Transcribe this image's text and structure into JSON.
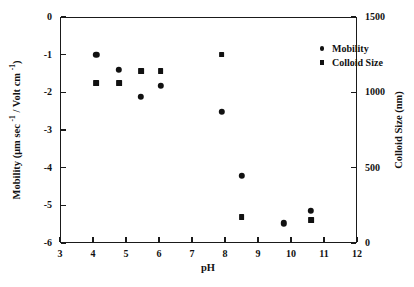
{
  "chart_data": {
    "type": "scatter",
    "title": "",
    "xlabel": "pH",
    "ylabel": "Mobility (μm sec -1 / Volt cm -1)",
    "ylabel_right": "Colloid Size (nm)",
    "xlim": [
      3,
      12
    ],
    "ylim": [
      -6,
      0
    ],
    "ylim_right": [
      0,
      1500
    ],
    "grid": false,
    "legend_position": "top-right",
    "xticks": [
      3,
      4,
      5,
      6,
      7,
      8,
      9,
      10,
      11,
      12
    ],
    "xtick_labels": [
      "3",
      "4",
      "5",
      "6",
      "7",
      "8",
      "9",
      "10",
      "11",
      "12"
    ],
    "yticks": [
      0,
      -1,
      -2,
      -3,
      -4,
      -5,
      -6
    ],
    "ytick_labels": [
      "0",
      "-1",
      "-2",
      "-3",
      "-4",
      "-5",
      "-6"
    ],
    "yticks_right": [
      0,
      500,
      1000,
      1500
    ],
    "ytick_labels_right": [
      "0",
      "500",
      "1000",
      "1500"
    ],
    "series": [
      {
        "name": "Mobility",
        "marker": "circle",
        "axis": "left",
        "color": "#111111",
        "points": [
          {
            "x": 4.1,
            "y": -1.0
          },
          {
            "x": 4.78,
            "y": -1.4
          },
          {
            "x": 5.45,
            "y": -2.12
          },
          {
            "x": 6.05,
            "y": -1.83
          },
          {
            "x": 7.9,
            "y": -2.52
          },
          {
            "x": 8.5,
            "y": -4.21
          },
          {
            "x": 9.78,
            "y": -5.48
          },
          {
            "x": 10.6,
            "y": -5.14
          }
        ]
      },
      {
        "name": "Colloid Size",
        "marker": "square",
        "axis": "right",
        "color": "#111111",
        "points": [
          {
            "x": 4.1,
            "y": 1060
          },
          {
            "x": 4.78,
            "y": 1060
          },
          {
            "x": 5.45,
            "y": 1140
          },
          {
            "x": 6.05,
            "y": 1140
          },
          {
            "x": 7.9,
            "y": 1250
          },
          {
            "x": 8.5,
            "y": 170
          },
          {
            "x": 10.6,
            "y": 150
          }
        ]
      }
    ]
  },
  "axes": {
    "x_title": "pH",
    "y_left_title_parts": {
      "a": "Mobility (μm sec ",
      "sup1": "-1",
      "b": " / Volt cm ",
      "sup2": "-1",
      "c": ")"
    },
    "y_right_title": "Colloid Size (nm)"
  },
  "legend": {
    "items": [
      {
        "label": "Mobility",
        "marker": "circle"
      },
      {
        "label": "Colloid Size",
        "marker": "square"
      }
    ]
  }
}
